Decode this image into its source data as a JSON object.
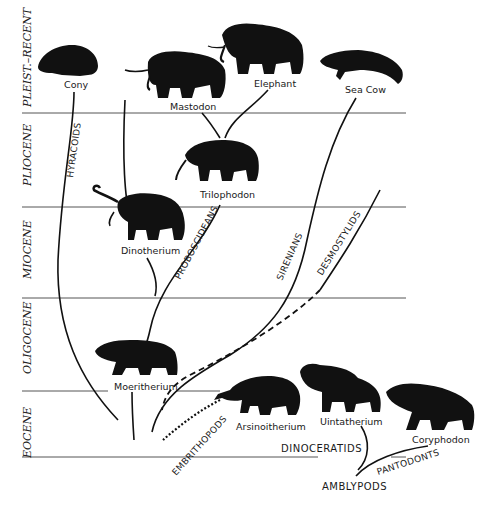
{
  "eras": [
    {
      "label": "PLEIST.–RECENT",
      "y_top": 0,
      "y_bottom": 113
    },
    {
      "label": "PLIOCENE",
      "y_top": 113,
      "y_bottom": 207
    },
    {
      "label": "MIOCENE",
      "y_top": 207,
      "y_bottom": 298
    },
    {
      "label": "OLIGOCENE",
      "y_top": 298,
      "y_bottom": 391
    },
    {
      "label": "EOCENE",
      "y_top": 391,
      "y_bottom": 457
    }
  ],
  "animals": [
    {
      "name": "Cony",
      "era": "PLEIST.–RECENT"
    },
    {
      "name": "Mastodon",
      "era": "PLEIST.–RECENT"
    },
    {
      "name": "Elephant",
      "era": "PLEIST.–RECENT"
    },
    {
      "name": "Sea Cow",
      "era": "PLEIST.–RECENT"
    },
    {
      "name": "Trilophodon",
      "era": "PLIOCENE"
    },
    {
      "name": "Dinotherium",
      "era": "MIOCENE"
    },
    {
      "name": "Moeritherium",
      "era": "OLIGOCENE"
    },
    {
      "name": "Arsinoitherium",
      "era": "EOCENE"
    },
    {
      "name": "Uintatherium",
      "era": "EOCENE"
    },
    {
      "name": "Coryphodon",
      "era": "EOCENE"
    }
  ],
  "groups": [
    {
      "label": "HYRACOIDS"
    },
    {
      "label": "PROBOSCIDEANS"
    },
    {
      "label": "SIRENIANS"
    },
    {
      "label": "DESMOSTYLIDS"
    },
    {
      "label": "EMBRITHOPODS"
    },
    {
      "label": "DINOCERATIDS"
    },
    {
      "label": "PANTODONTS"
    },
    {
      "label": "AMBLYPODS"
    }
  ]
}
